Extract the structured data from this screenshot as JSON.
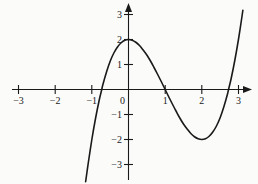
{
  "figure": {
    "background_color": "#fbfbfa",
    "ink_color": "#1a1a1a",
    "width": 258,
    "height": 184
  },
  "chart_data": {
    "type": "line",
    "title": "",
    "subtitle": "",
    "xlabel": "",
    "ylabel": "",
    "grid": false,
    "legend": null,
    "legend_position": "none",
    "xlim": [
      -3.25,
      3.35
    ],
    "ylim": [
      -3.45,
      3.3
    ],
    "x_ticks": [
      -3,
      -2,
      -1,
      0,
      1,
      2,
      3
    ],
    "y_ticks": [
      -3,
      -2,
      -1,
      0,
      1,
      2,
      3
    ],
    "x_tick_labels": [
      "−3",
      "−2",
      "−1",
      "0",
      "1",
      "2",
      "3"
    ],
    "y_tick_labels": [
      "−3",
      "−2",
      "−1",
      "0",
      "1",
      "2",
      "3"
    ],
    "axis_arrows": {
      "x_positive": true,
      "y_positive": true
    },
    "series": [
      {
        "name": "cubic",
        "equation": "y = x^3 - 3x^2 + 2",
        "color": "#1a1a1a",
        "line_width": 1.6,
        "x_domain": [
          -1.17,
          3.12
        ],
        "points": [
          [
            -1.17,
            -3.69
          ],
          [
            -1.1,
            -2.96
          ],
          [
            -1.0,
            -2.0
          ],
          [
            -0.9,
            -1.16
          ],
          [
            -0.8,
            -0.43
          ],
          [
            -0.73,
            0.0
          ],
          [
            -0.7,
            0.19
          ],
          [
            -0.6,
            0.7
          ],
          [
            -0.5,
            1.13
          ],
          [
            -0.4,
            1.46
          ],
          [
            -0.3,
            1.7
          ],
          [
            -0.2,
            1.87
          ],
          [
            -0.1,
            1.97
          ],
          [
            0.0,
            2.0
          ],
          [
            0.1,
            1.97
          ],
          [
            0.2,
            1.89
          ],
          [
            0.3,
            1.76
          ],
          [
            0.4,
            1.58
          ],
          [
            0.5,
            1.38
          ],
          [
            0.6,
            1.14
          ],
          [
            0.7,
            0.87
          ],
          [
            0.8,
            0.59
          ],
          [
            0.9,
            0.3
          ],
          [
            1.0,
            0.0
          ],
          [
            1.1,
            -0.3
          ],
          [
            1.2,
            -0.59
          ],
          [
            1.3,
            -0.87
          ],
          [
            1.4,
            -1.14
          ],
          [
            1.5,
            -1.38
          ],
          [
            1.6,
            -1.58
          ],
          [
            1.7,
            -1.76
          ],
          [
            1.8,
            -1.89
          ],
          [
            1.9,
            -1.97
          ],
          [
            2.0,
            -2.0
          ],
          [
            2.1,
            -1.97
          ],
          [
            2.2,
            -1.87
          ],
          [
            2.3,
            -1.7
          ],
          [
            2.4,
            -1.46
          ],
          [
            2.5,
            -1.13
          ],
          [
            2.6,
            -0.7
          ],
          [
            2.7,
            -0.19
          ],
          [
            2.73,
            0.0
          ],
          [
            2.8,
            0.43
          ],
          [
            2.9,
            1.16
          ],
          [
            3.0,
            2.0
          ],
          [
            3.1,
            2.96
          ],
          [
            3.12,
            3.17
          ]
        ],
        "local_maximum": [
          0,
          2
        ],
        "local_minimum": [
          2,
          -2
        ],
        "x_intercepts": [
          -0.73,
          1.0,
          2.73
        ],
        "y_intercept": 2
      }
    ]
  }
}
